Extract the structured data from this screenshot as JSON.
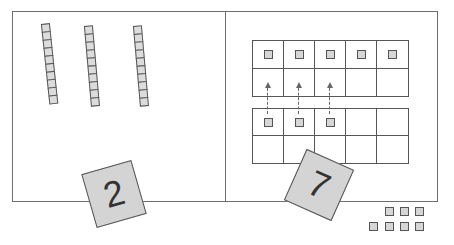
{
  "diagram": {
    "left_panel": {
      "rods": [
        {
          "label": "ten-rod-1",
          "cubes": 10
        },
        {
          "label": "ten-rod-2",
          "cubes": 10
        },
        {
          "label": "ten-rod-3",
          "cubes": 10
        }
      ],
      "card": {
        "value": "2"
      }
    },
    "right_panel": {
      "top_frame": {
        "rows": 2,
        "cols": 5,
        "filled": [
          0,
          1,
          2,
          3,
          4
        ]
      },
      "bottom_frame": {
        "rows": 2,
        "cols": 5,
        "filled": [
          0,
          1,
          2
        ]
      },
      "arrows": {
        "count": 3,
        "direction": "up",
        "style": "dashed"
      },
      "card": {
        "value": "7"
      }
    },
    "loose_cubes": {
      "top_row": 3,
      "bottom_row": 4,
      "total": 7
    },
    "colors": {
      "line": "#555555",
      "fill": "#d6d6d6",
      "card": "#d4d4d4",
      "border": "#6e6e6e"
    }
  }
}
